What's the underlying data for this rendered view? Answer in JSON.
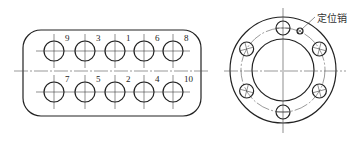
{
  "figure": {
    "left_part": {
      "shape": "rounded-rectangle",
      "bolt_holes_top": [
        {
          "number": "9",
          "x": 54,
          "y": 51
        },
        {
          "number": "3",
          "x": 85,
          "y": 51
        },
        {
          "number": "1",
          "x": 115,
          "y": 51
        },
        {
          "number": "6",
          "x": 144,
          "y": 51
        },
        {
          "number": "8",
          "x": 173,
          "y": 51
        }
      ],
      "bolt_holes_bottom": [
        {
          "number": "7",
          "x": 54,
          "y": 92
        },
        {
          "number": "5",
          "x": 85,
          "y": 92
        },
        {
          "number": "2",
          "x": 115,
          "y": 92
        },
        {
          "number": "4",
          "x": 144,
          "y": 92
        },
        {
          "number": "10",
          "x": 173,
          "y": 92
        }
      ]
    },
    "right_part": {
      "shape": "flange",
      "bolt_hole_count": 6,
      "dowel_label": "定位销"
    }
  }
}
